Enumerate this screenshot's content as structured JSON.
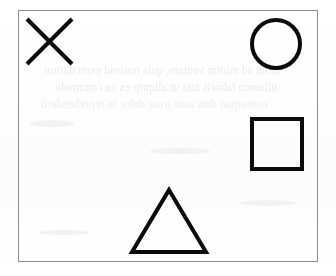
{
  "page": {
    "kind": "scanned-page",
    "width": 336,
    "height": 276,
    "paper_color": "#fefefe",
    "ink_color": "#0b0b0b",
    "border_color": "#8b8b90"
  },
  "frame": {
    "label": "drawn rectangle border",
    "x": 18,
    "y": 10,
    "width": 300,
    "height": 252,
    "stroke_width": 1
  },
  "shapes": [
    {
      "id": "x-mark",
      "name": "X",
      "type": "cross",
      "stroke_color": "#0b0b0b",
      "stroke_width": 4,
      "bounds": {
        "x": 27,
        "y": 19,
        "width": 45,
        "height": 45
      },
      "position": "top-left"
    },
    {
      "id": "circle",
      "name": "Circle",
      "type": "circle",
      "stroke_color": "#0b0b0b",
      "stroke_width": 4,
      "bounds": {
        "x": 251,
        "y": 19,
        "width": 51,
        "height": 50
      },
      "position": "top-right"
    },
    {
      "id": "square",
      "name": "Square",
      "type": "square",
      "stroke_color": "#0b0b0b",
      "stroke_width": 4,
      "bounds": {
        "x": 250,
        "y": 117,
        "width": 53,
        "height": 53
      },
      "position": "middle-right"
    },
    {
      "id": "triangle",
      "name": "Triangle",
      "type": "triangle",
      "stroke_color": "#0b0b0b",
      "stroke_width": 4,
      "bounds": {
        "x": 132,
        "y": 189,
        "width": 73,
        "height": 64
      },
      "position": "bottom-center"
    }
  ],
  "bleed_through": {
    "note": "faint mirrored text showing through from the reverse side of the sheet",
    "mirrored": true,
    "opacity": 0.11,
    "color": "#4d4a48",
    "lines": [
      "anim ad minim veniam, quis nostrud exercitation",
      "ullamco laboris nisi ut aliquip ex ea commodo",
      "consequat duis aute irure dolor in reprehenderit"
    ]
  }
}
